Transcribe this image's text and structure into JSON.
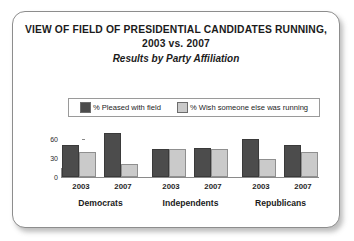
{
  "card": {
    "title_lines": [
      "VIEW OF FIELD OF PRESIDENTIAL CANDIDATES RUNNING,",
      "2003 vs. 2007"
    ],
    "subtitle": "Results by Party Affiliation"
  },
  "legend": {
    "entries": [
      {
        "label": "% Pleased with field",
        "color": "#4c4c4c"
      },
      {
        "label": "% Wish someone else was running",
        "color": "#cacaca"
      }
    ]
  },
  "colors": {
    "series_pleased": "#4c4c4c",
    "series_wish": "#cacaca",
    "axis": "#8a8a8a",
    "card_border": "#8d8d8d",
    "text": "#1b1b1b"
  },
  "chart_data": {
    "type": "bar",
    "title": "VIEW OF FIELD OF PRESIDENTIAL CANDIDATES RUNNING, 2003 vs. 2007",
    "subtitle": "Results by Party Affiliation",
    "xlabel": "",
    "ylabel": "",
    "ylim": [
      0,
      75
    ],
    "yticks": [
      0,
      30,
      60
    ],
    "ytick_labels": [
      "0",
      "30",
      "60"
    ],
    "grid": false,
    "legend_position": "top-center",
    "groups": [
      "Democrats",
      "Independents",
      "Republicans"
    ],
    "subcategories": [
      "2003",
      "2007"
    ],
    "categories": [
      "Democrats 2003",
      "Democrats 2007",
      "Independents 2003",
      "Independents 2007",
      "Republicans 2003",
      "Republicans 2007"
    ],
    "series": [
      {
        "name": "% Pleased with field",
        "color": "#4c4c4c",
        "values": [
          50,
          70,
          45,
          46,
          60,
          50
        ]
      },
      {
        "name": "% Wish someone else was running",
        "color": "#cacaca",
        "values": [
          40,
          20,
          45,
          44,
          28,
          40
        ]
      }
    ]
  }
}
